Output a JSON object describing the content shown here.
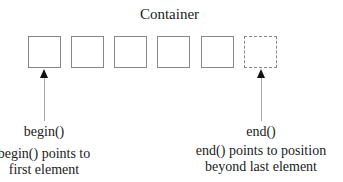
{
  "title": "Container",
  "boxes": [
    {
      "left": 28,
      "style": "solid"
    },
    {
      "left": 71,
      "style": "solid"
    },
    {
      "left": 114,
      "style": "solid"
    },
    {
      "left": 157,
      "style": "solid"
    },
    {
      "left": 201,
      "style": "solid"
    },
    {
      "left": 244,
      "style": "dashed"
    }
  ],
  "pointers": {
    "begin": {
      "label": "begin()",
      "description_line1": "begin() points to",
      "description_line2": "first element"
    },
    "end": {
      "label": "end()",
      "description_line1": "end() points to position",
      "description_line2": "beyond last element"
    }
  }
}
